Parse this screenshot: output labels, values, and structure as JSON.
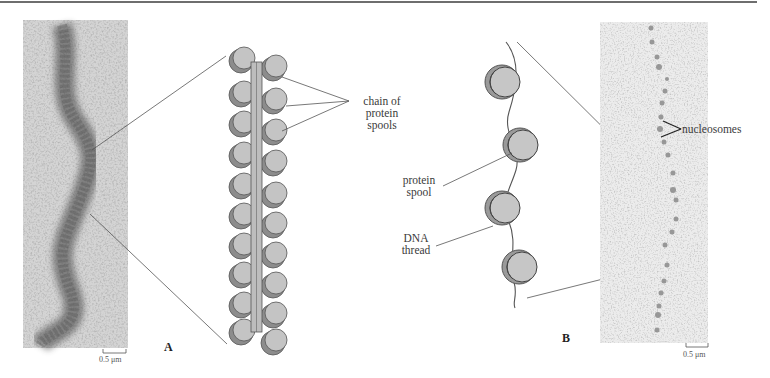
{
  "figure": {
    "panels": [
      {
        "id": "A",
        "letter": "A",
        "micrograph": {
          "scale_bar": "0.5 μm"
        },
        "diagram_label": {
          "lines": [
            "chain of",
            "protein",
            "spools"
          ]
        }
      },
      {
        "id": "B",
        "letter": "B",
        "diagram_labels": {
          "protein_spool": [
            "protein",
            "spool"
          ],
          "dna_thread": [
            "DNA",
            "thread"
          ]
        },
        "micrograph": {
          "scale_bar": "0.5 μm",
          "annotation": "nucleosomes"
        }
      }
    ],
    "colors": {
      "spool_fill": "#c4c4c4",
      "spool_shadow": "#8c8c8c",
      "outline": "#555555",
      "leader_line": "#555555",
      "micrograph_A_bg": "#bcbcbc",
      "micrograph_B_bg": "#e4e4e4"
    }
  }
}
